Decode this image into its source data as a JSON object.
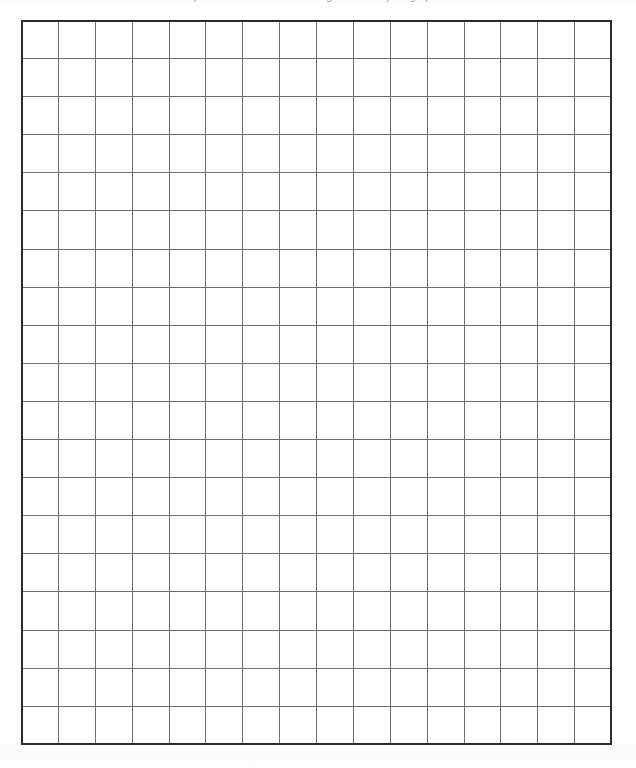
{
  "document": {
    "type": "worksheet",
    "header_note": "Plot the function on the coordinate plane below. Use the blank grid to draw your graph.",
    "background_color": "#ffffff"
  },
  "grid": {
    "columns": 16,
    "rows": 19,
    "cell_width_px": 36.9,
    "cell_height_px": 38.2,
    "left_px": 21,
    "top_px": 20,
    "width_px": 591,
    "height_px": 725,
    "border_color": "#2b2b2d",
    "border_width_px": 2,
    "line_color": "#6b6e72",
    "line_width_px": 1,
    "cell_fill": "#ffffff",
    "cells": []
  }
}
